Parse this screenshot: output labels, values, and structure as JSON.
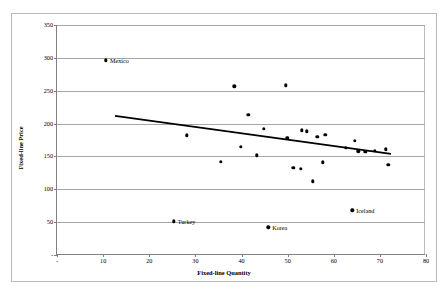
{
  "chart_data": {
    "type": "scatter",
    "title": "",
    "xlabel": "Fixed-line Quantity",
    "ylabel": "Fixed-line Price",
    "xlim": [
      0,
      80
    ],
    "ylim": [
      0,
      350
    ],
    "xticks": [
      "-",
      "10",
      "20",
      "30",
      "40",
      "50",
      "60",
      "70",
      "80"
    ],
    "xtick_values": [
      0,
      10,
      20,
      30,
      40,
      50,
      60,
      70,
      80
    ],
    "yticks": [
      "-",
      "50",
      "100",
      "150",
      "200",
      "250",
      "300",
      "350"
    ],
    "ytick_values": [
      0,
      50,
      100,
      150,
      200,
      250,
      300,
      350
    ],
    "grid": "horizontal",
    "legend": "none",
    "series": [
      {
        "name": "Countries",
        "marker": "filled-diamond",
        "color": "#000000",
        "points": [
          {
            "x": 10.6,
            "y": 296,
            "label": "Mexico",
            "label_pos": "right"
          },
          {
            "x": 25.3,
            "y": 51,
            "label": "Turkey",
            "label_pos": "right"
          },
          {
            "x": 45.8,
            "y": 42,
            "label": "Korea",
            "label_pos": "right"
          },
          {
            "x": 64.0,
            "y": 68,
            "label": "Iceland",
            "label_pos": "right"
          },
          {
            "x": 28.1,
            "y": 182,
            "label": "",
            "label_pos": ""
          },
          {
            "x": 35.5,
            "y": 142,
            "label": "",
            "label_pos": ""
          },
          {
            "x": 38.4,
            "y": 257,
            "label": "",
            "label_pos": ""
          },
          {
            "x": 39.8,
            "y": 165,
            "label": "",
            "label_pos": ""
          },
          {
            "x": 41.5,
            "y": 213,
            "label": "",
            "label_pos": ""
          },
          {
            "x": 43.3,
            "y": 152,
            "label": "",
            "label_pos": ""
          },
          {
            "x": 44.8,
            "y": 192,
            "label": "",
            "label_pos": ""
          },
          {
            "x": 49.6,
            "y": 258,
            "label": "",
            "label_pos": ""
          },
          {
            "x": 49.9,
            "y": 178,
            "label": "",
            "label_pos": ""
          },
          {
            "x": 51.2,
            "y": 133,
            "label": "",
            "label_pos": ""
          },
          {
            "x": 52.8,
            "y": 131,
            "label": "",
            "label_pos": ""
          },
          {
            "x": 53.1,
            "y": 190,
            "label": "",
            "label_pos": ""
          },
          {
            "x": 54.2,
            "y": 188,
            "label": "",
            "label_pos": ""
          },
          {
            "x": 55.5,
            "y": 112,
            "label": "",
            "label_pos": ""
          },
          {
            "x": 56.4,
            "y": 180,
            "label": "",
            "label_pos": ""
          },
          {
            "x": 57.6,
            "y": 141,
            "label": "",
            "label_pos": ""
          },
          {
            "x": 58.2,
            "y": 183,
            "label": "",
            "label_pos": ""
          },
          {
            "x": 62.6,
            "y": 163,
            "label": "",
            "label_pos": ""
          },
          {
            "x": 64.5,
            "y": 174,
            "label": "",
            "label_pos": ""
          },
          {
            "x": 65.3,
            "y": 158,
            "label": "",
            "label_pos": ""
          },
          {
            "x": 66.8,
            "y": 157,
            "label": "",
            "label_pos": ""
          },
          {
            "x": 68.9,
            "y": 159,
            "label": "",
            "label_pos": ""
          },
          {
            "x": 71.3,
            "y": 161,
            "label": "",
            "label_pos": ""
          },
          {
            "x": 71.8,
            "y": 137,
            "label": "",
            "label_pos": ""
          }
        ]
      }
    ],
    "trendline": {
      "name": "linear-fit",
      "color": "#000000",
      "x0": 12.6,
      "y0": 211,
      "x1": 72.6,
      "y1": 153
    }
  }
}
